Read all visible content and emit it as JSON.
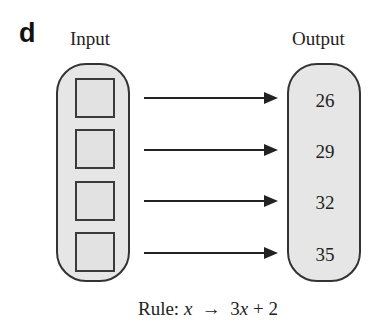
{
  "panel_label": "d",
  "headers": {
    "input": "Input",
    "output": "Output"
  },
  "inputs": [
    "",
    "",
    "",
    ""
  ],
  "outputs": [
    "26",
    "29",
    "32",
    "35"
  ],
  "rule": {
    "prefix": "Rule: ",
    "var": "x",
    "arrow": "→",
    "coef": "3",
    "var2": "x",
    "suffix": " + 2"
  },
  "colors": {
    "capsule_fill": "#e6e6e6",
    "stroke": "#333333"
  }
}
